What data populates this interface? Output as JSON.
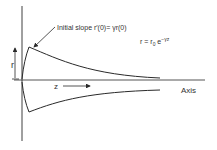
{
  "diagram": {
    "annotation": {
      "slope_label": "Initial slope r′(0)= γr(0)",
      "equation_base": "r = r",
      "equation_sub": "0",
      "equation_exp_prefix": " e",
      "equation_exp": "−γz"
    },
    "labels": {
      "r_axis": "r",
      "z_axis": "z",
      "axis": "Axis"
    },
    "colors": {
      "stroke": "#2a2a2a",
      "text": "#333333",
      "background": "#ffffff"
    }
  }
}
